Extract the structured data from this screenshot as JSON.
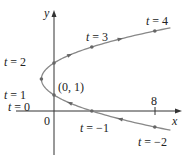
{
  "axes": {
    "x_label": "x",
    "y_label": "y",
    "origin_label": "0",
    "x_tick_label": "8"
  },
  "point_label": "(0, 1)",
  "curve_color": "#888888",
  "labels": [
    {
      "t": "t = 4",
      "x": 146,
      "y": 25
    },
    {
      "t": "t = 3",
      "x": 86,
      "y": 41
    },
    {
      "t": "t = 2",
      "x": 4,
      "y": 66
    },
    {
      "t": "t = 1",
      "x": 4,
      "y": 99
    },
    {
      "t": "t = 0",
      "x": 8,
      "y": 111
    },
    {
      "t": "t = −1",
      "x": 80,
      "y": 132
    },
    {
      "t": "t = −2",
      "x": 138,
      "y": 146
    }
  ],
  "chart_data": {
    "type": "scatter",
    "title": "",
    "xlabel": "x",
    "ylabel": "y",
    "parametric": "x = t^2 - 2t, y = t + 1",
    "points": [
      {
        "t": -2,
        "x": 8,
        "y": -1
      },
      {
        "t": -1,
        "x": 3,
        "y": 0
      },
      {
        "t": 0,
        "x": 0,
        "y": 1
      },
      {
        "t": 1,
        "x": -1,
        "y": 2
      },
      {
        "t": 2,
        "x": 0,
        "y": 3
      },
      {
        "t": 3,
        "x": 3,
        "y": 4
      },
      {
        "t": 4,
        "x": 8,
        "y": 5
      }
    ],
    "annotations": [
      "(0, 1)",
      "8",
      "0"
    ]
  }
}
